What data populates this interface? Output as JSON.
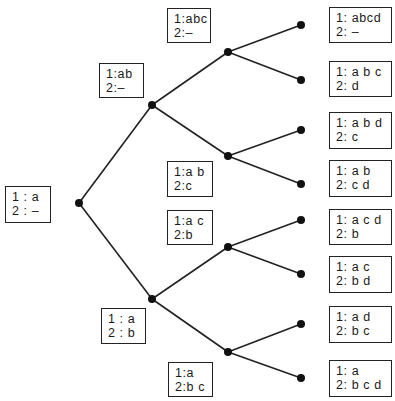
{
  "diagram": {
    "type": "binary-tree",
    "line_color": "#222222",
    "node_color": "#111111",
    "nodes": [
      {
        "id": "root",
        "x": 79,
        "y": 203
      },
      {
        "id": "n1a",
        "x": 152,
        "y": 105
      },
      {
        "id": "n1b",
        "x": 152,
        "y": 299
      },
      {
        "id": "n2a",
        "x": 228,
        "y": 52
      },
      {
        "id": "n2b",
        "x": 228,
        "y": 156
      },
      {
        "id": "n2c",
        "x": 228,
        "y": 247
      },
      {
        "id": "n2d",
        "x": 228,
        "y": 352
      },
      {
        "id": "l1",
        "x": 301,
        "y": 25
      },
      {
        "id": "l2",
        "x": 301,
        "y": 80
      },
      {
        "id": "l3",
        "x": 301,
        "y": 130
      },
      {
        "id": "l4",
        "x": 301,
        "y": 184
      },
      {
        "id": "l5",
        "x": 301,
        "y": 220
      },
      {
        "id": "l6",
        "x": 301,
        "y": 274
      },
      {
        "id": "l7",
        "x": 301,
        "y": 324
      },
      {
        "id": "l8",
        "x": 301,
        "y": 378
      }
    ],
    "edges": [
      [
        "root",
        "n1a"
      ],
      [
        "root",
        "n1b"
      ],
      [
        "n1a",
        "n2a"
      ],
      [
        "n1a",
        "n2b"
      ],
      [
        "n1b",
        "n2c"
      ],
      [
        "n1b",
        "n2d"
      ],
      [
        "n2a",
        "l1"
      ],
      [
        "n2a",
        "l2"
      ],
      [
        "n2b",
        "l3"
      ],
      [
        "n2b",
        "l4"
      ],
      [
        "n2c",
        "l5"
      ],
      [
        "n2c",
        "l6"
      ],
      [
        "n2d",
        "l7"
      ],
      [
        "n2d",
        "l8"
      ]
    ],
    "labels": {
      "root": {
        "line1": "1 : a",
        "line2": "2 : –"
      },
      "n1a": {
        "line1": "1:ab",
        "line2": "2:–"
      },
      "n1b": {
        "line1": "1 : a",
        "line2": "2 : b"
      },
      "n2a": {
        "line1": "1:abc",
        "line2": "2:–"
      },
      "n2b": {
        "line1": "1:a b",
        "line2": "2:c"
      },
      "n2c": {
        "line1": "1:a c",
        "line2": "2:b"
      },
      "n2d": {
        "line1": "1:a",
        "line2": "2:b c"
      },
      "l1": {
        "line1": "1: abcd",
        "line2": "2: –"
      },
      "l2": {
        "line1": "1: a b c",
        "line2": "2: d"
      },
      "l3": {
        "line1": "1: a b d",
        "line2": "2: c"
      },
      "l4": {
        "line1": "1: a b",
        "line2": "2: c d"
      },
      "l5": {
        "line1": "1: a c d",
        "line2": "2: b"
      },
      "l6": {
        "line1": "1: a c",
        "line2": "2: b d"
      },
      "l7": {
        "line1": "1: a d",
        "line2": "2: b c"
      },
      "l8": {
        "line1": "1: a",
        "line2": "2: b c d"
      }
    }
  }
}
